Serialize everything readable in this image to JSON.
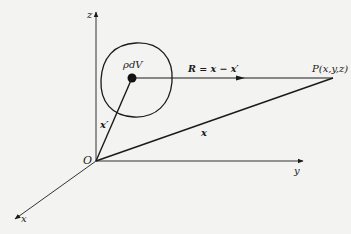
{
  "diagram": {
    "type": "vector-geometry",
    "colors": {
      "background": "#f3f3f1",
      "ink": "#1a1a1a"
    },
    "axes": {
      "z_label": "z",
      "y_label": "y",
      "x_label": "x",
      "origin_label": "O"
    },
    "source": {
      "label": "ρdV",
      "region": "closed volume (circle)"
    },
    "vectors": {
      "separation_label": "R = x − x′",
      "source_position_label": "x′",
      "field_position_label": "x"
    },
    "field_point": {
      "label": "P(x,y,z)"
    }
  }
}
